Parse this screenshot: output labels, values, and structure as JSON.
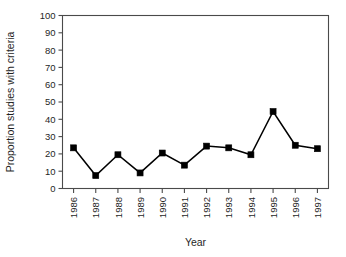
{
  "chart_data": {
    "type": "line",
    "title": "",
    "xlabel": "Year",
    "ylabel": "Proportion studies with criteria",
    "categories": [
      "1986",
      "1987",
      "1988",
      "1989",
      "1990",
      "1991",
      "1992",
      "1993",
      "1994",
      "1995",
      "1996",
      "1997"
    ],
    "values": [
      23.5,
      7.5,
      19.5,
      9.0,
      20.5,
      13.5,
      24.5,
      23.5,
      19.5,
      44.5,
      25.0,
      23.0
    ],
    "series": [
      {
        "name": "Proportion studies with criteria",
        "values": [
          23.5,
          7.5,
          19.5,
          9.0,
          20.5,
          13.5,
          24.5,
          23.5,
          19.5,
          44.5,
          25.0,
          23.0
        ]
      }
    ],
    "ylim": [
      0,
      100
    ],
    "yticks": [
      0,
      10,
      20,
      30,
      40,
      50,
      60,
      70,
      80,
      90,
      100
    ],
    "ytick_labels": [
      "0",
      "10",
      "20",
      "30",
      "40",
      "50",
      "60",
      "70",
      "80",
      "90",
      "100"
    ],
    "xtick_labels": [
      "1986",
      "1987",
      "1988",
      "1989",
      "1990",
      "1991",
      "1992",
      "1993",
      "1994",
      "1995",
      "1996",
      "1997"
    ],
    "grid": false,
    "legend": false,
    "legend_position": "none",
    "marker": "square",
    "marker_color": "#000000",
    "line_color": "#000000",
    "frame_color": "#4a4a4a",
    "background_color": "#ffffff",
    "xtick_label_rotation": -90
  }
}
